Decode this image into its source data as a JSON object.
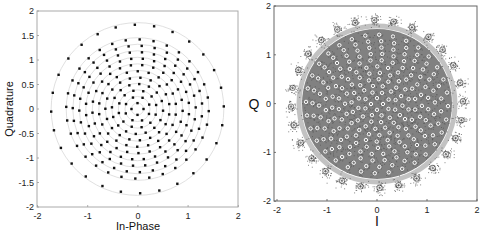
{
  "chart_data": [
    {
      "type": "scatter",
      "title": "",
      "xlabel": "In-Phase",
      "ylabel": "Quadrature",
      "xlim": [
        -2,
        2
      ],
      "ylim": [
        -2,
        2
      ],
      "xticks": [
        "-2",
        "-1",
        "0",
        "1",
        "2"
      ],
      "yticks": [
        "-2",
        "-1.5",
        "-1",
        "-0.5",
        "0",
        "0.5",
        "1",
        "1.5",
        "2"
      ],
      "grid": false,
      "legend": null,
      "description": "Ideal multi-ring constellation: concentric rings of symbols with faint gray ring guides",
      "rings": [
        {
          "radius": 0.12,
          "points": 4
        },
        {
          "radius": 0.25,
          "points": 8
        },
        {
          "radius": 0.38,
          "points": 12
        },
        {
          "radius": 0.51,
          "points": 16
        },
        {
          "radius": 0.64,
          "points": 19
        },
        {
          "radius": 0.77,
          "points": 22
        },
        {
          "radius": 0.9,
          "points": 25
        },
        {
          "radius": 1.03,
          "points": 28
        },
        {
          "radius": 1.16,
          "points": 30
        },
        {
          "radius": 1.29,
          "points": 31
        },
        {
          "radius": 1.42,
          "points": 32
        },
        {
          "radius": 1.72,
          "points": 28
        }
      ],
      "marker_color": "#111111",
      "ring_guide_color": "#d8d8d8"
    },
    {
      "type": "scatter",
      "title": "",
      "xlabel": "I",
      "ylabel": "Q",
      "xlim": [
        -2,
        2
      ],
      "ylim": [
        -2,
        2
      ],
      "xticks": [
        "-2",
        "-1",
        "0",
        "1",
        "2"
      ],
      "yticks": [
        "-2",
        "-1",
        "0",
        "1",
        "2"
      ],
      "grid": false,
      "legend": null,
      "description": "Received noisy constellation: dark noise clouds around each symbol with white circle markers at ideal points",
      "rings": [
        {
          "radius": 0.12,
          "points": 4
        },
        {
          "radius": 0.25,
          "points": 8
        },
        {
          "radius": 0.38,
          "points": 12
        },
        {
          "radius": 0.51,
          "points": 16
        },
        {
          "radius": 0.64,
          "points": 19
        },
        {
          "radius": 0.77,
          "points": 22
        },
        {
          "radius": 0.9,
          "points": 25
        },
        {
          "radius": 1.03,
          "points": 28
        },
        {
          "radius": 1.16,
          "points": 30
        },
        {
          "radius": 1.29,
          "points": 31
        },
        {
          "radius": 1.42,
          "points": 32
        },
        {
          "radius": 1.72,
          "points": 28
        }
      ],
      "cloud_color": "#555555",
      "marker_color": "#ffffff"
    }
  ],
  "left_plot": {
    "xlabel": "In-Phase",
    "ylabel": "Quadrature",
    "xticks": [
      "-2",
      "-1",
      "0",
      "1",
      "2"
    ],
    "yticks": [
      "2",
      "1.5",
      "1",
      "0.5",
      "0",
      "-0.5",
      "-1",
      "-1.5",
      "-2"
    ]
  },
  "right_plot": {
    "xlabel": "I",
    "ylabel": "Q",
    "xticks": [
      "-2",
      "-1",
      "0",
      "1",
      "2"
    ],
    "yticks": [
      "2",
      "1",
      "0",
      "-1",
      "-2"
    ]
  }
}
